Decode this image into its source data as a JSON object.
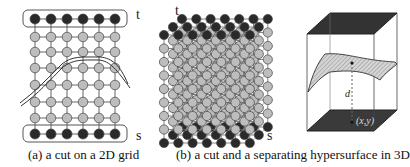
{
  "figure": {
    "panels": [
      {
        "id": "a",
        "caption": "(a) a cut on a 2D grid",
        "source_label": "s",
        "sink_label": "t",
        "grid": {
          "columns": 6,
          "interior_rows": 6,
          "terminal_rows": 2
        }
      },
      {
        "id": "b",
        "caption": "(b) a cut and a separating hypersurface in 3D",
        "source_label": "s",
        "sink_label": "t",
        "grid": {
          "columns": 7,
          "rows": 9,
          "depth_layers": 3
        }
      },
      {
        "id": "c",
        "distance_label": "d",
        "point_label": "(x,y)"
      }
    ],
    "colors": {
      "terminal_node": "#2a2a2a",
      "interior_node": "#bdbdbd",
      "edge": "#555555",
      "plate": "#333333"
    }
  }
}
